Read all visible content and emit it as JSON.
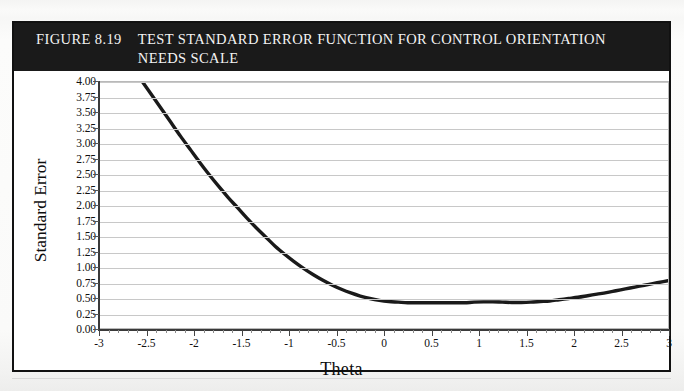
{
  "figure": {
    "number": "FIGURE 8.19",
    "title": "TEST STANDARD ERROR FUNCTION FOR CONTROL ORIENTATION NEEDS SCALE",
    "header_background": "#1a1a1a",
    "header_text_color": "#f2f2f2",
    "border_color": "#111111"
  },
  "chart_data": {
    "type": "line",
    "title": "TEST STANDARD ERROR FUNCTION FOR CONTROL ORIENTATION NEEDS SCALE",
    "xlabel": "Theta",
    "ylabel": "Standard Error",
    "xlim": [
      -3,
      3
    ],
    "ylim": [
      0.0,
      4.0
    ],
    "grid": true,
    "legend": false,
    "series_color": "#1a1a1a",
    "xticks": [
      -3,
      -2.5,
      -2,
      -1.5,
      -1,
      -0.5,
      0,
      0.5,
      1,
      1.5,
      2,
      2.5,
      3
    ],
    "xtick_labels": [
      "-3",
      "-2.5",
      "-2",
      "-1.5",
      "-1",
      "-0.5",
      "0",
      "0.5",
      "1",
      "1.5",
      "2",
      "2.5",
      "3"
    ],
    "xtick_minor_step": 0.1,
    "yticks": [
      0.0,
      0.25,
      0.5,
      0.75,
      1.0,
      1.25,
      1.5,
      1.75,
      2.0,
      2.25,
      2.5,
      2.75,
      3.0,
      3.25,
      3.5,
      3.75,
      4.0
    ],
    "ytick_labels": [
      "0.00",
      "0.25",
      "0.50",
      "0.75",
      "1.00",
      "1.25",
      "1.50",
      "1.75",
      "2.00",
      "2.25",
      "2.50",
      "2.75",
      "3.00",
      "3.25",
      "3.50",
      "3.75",
      "4.00"
    ],
    "series": [
      {
        "name": "Standard Error",
        "x": [
          -2.55,
          -2.45,
          -2.35,
          -2.25,
          -2.15,
          -2.05,
          -1.95,
          -1.85,
          -1.75,
          -1.65,
          -1.55,
          -1.45,
          -1.35,
          -1.25,
          -1.15,
          -1.05,
          -0.95,
          -0.85,
          -0.75,
          -0.65,
          -0.55,
          -0.45,
          -0.35,
          -0.25,
          -0.15,
          -0.05,
          0.05,
          0.15,
          0.25,
          0.35,
          0.45,
          0.55,
          0.65,
          0.75,
          0.85,
          0.95,
          1.05,
          1.15,
          1.25,
          1.35,
          1.45,
          1.55,
          1.65,
          1.75,
          1.85,
          1.95,
          2.05,
          2.15,
          2.25,
          2.35,
          2.45,
          2.55,
          2.65,
          2.75,
          2.85,
          2.95,
          3.0
        ],
        "y": [
          4.0,
          3.78,
          3.56,
          3.34,
          3.12,
          2.91,
          2.7,
          2.5,
          2.31,
          2.13,
          1.96,
          1.79,
          1.63,
          1.48,
          1.33,
          1.2,
          1.08,
          0.97,
          0.87,
          0.78,
          0.7,
          0.63,
          0.57,
          0.52,
          0.48,
          0.45,
          0.43,
          0.42,
          0.41,
          0.41,
          0.41,
          0.41,
          0.41,
          0.41,
          0.41,
          0.42,
          0.425,
          0.425,
          0.42,
          0.415,
          0.415,
          0.42,
          0.43,
          0.44,
          0.46,
          0.48,
          0.5,
          0.525,
          0.55,
          0.575,
          0.605,
          0.635,
          0.665,
          0.695,
          0.725,
          0.755,
          0.77
        ]
      }
    ],
    "annotations": [
      {
        "text": "minimum standard error ~0.41 near theta 0 to 1.5"
      },
      {
        "text": "curve truncated at top at y = 4.00 near theta = -2.55"
      }
    ]
  }
}
